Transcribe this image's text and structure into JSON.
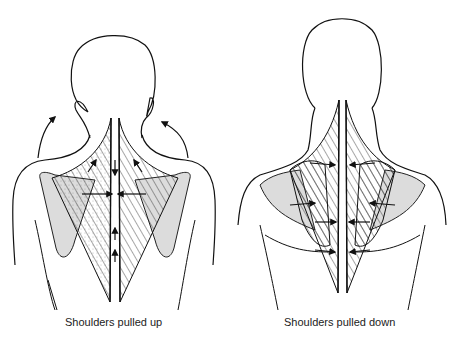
{
  "figures": [
    {
      "id": "left",
      "caption": "Shoulders pulled up",
      "arrows": [
        "upward-curved-left",
        "upward-curved-right",
        "converging-horizontal",
        "upward-along-spine"
      ]
    },
    {
      "id": "right",
      "caption": "Shoulders pulled down",
      "arrows": [
        "converging-horizontal-top",
        "converging-horizontal-mid",
        "converging-horizontal-low",
        "converging-horizontal-bottom"
      ]
    }
  ],
  "colors": {
    "line": "#111111",
    "scapula_fill": "#dcdcdc",
    "background": "#ffffff"
  }
}
